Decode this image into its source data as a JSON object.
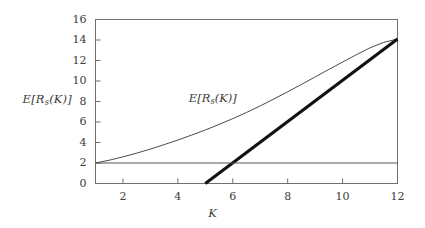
{
  "chart_data": {
    "type": "line",
    "title": "",
    "subtitle": "",
    "xlabel": "K",
    "ylabel": "E[R_s(K)]",
    "xlim": [
      1,
      12
    ],
    "ylim": [
      0,
      16
    ],
    "grid": false,
    "legend_position": "none",
    "xticks": [
      2,
      4,
      6,
      8,
      10,
      12
    ],
    "xtick_labels": [
      "2",
      "4",
      "6",
      "8",
      "10",
      "12"
    ],
    "yticks": [
      0,
      2,
      4,
      6,
      8,
      10,
      12,
      14,
      16
    ],
    "ytick_labels": [
      "0",
      "2",
      "4",
      "6",
      "8",
      "10",
      "12",
      "14",
      "16"
    ],
    "annotations": [
      {
        "text": "E[R_s(K)]",
        "x": 4.4,
        "y": 8.2
      }
    ],
    "series": [
      {
        "name": "E[R_s(K)]",
        "style": "thin-curve",
        "x": [
          1,
          1.5,
          2,
          2.5,
          3,
          3.5,
          4,
          4.5,
          5,
          5.5,
          6,
          6.5,
          7,
          7.5,
          8,
          8.5,
          9,
          9.5,
          10,
          10.5,
          11,
          11.5,
          12
        ],
        "values": [
          2.0,
          2.27,
          2.6,
          2.96,
          3.36,
          3.79,
          4.24,
          4.72,
          5.22,
          5.76,
          6.33,
          6.93,
          7.57,
          8.25,
          8.95,
          9.66,
          10.4,
          11.13,
          11.85,
          12.56,
          13.24,
          13.77,
          14.1
        ]
      },
      {
        "name": "asymptote-line",
        "style": "thick-line",
        "x": [
          5,
          12
        ],
        "values": [
          0,
          14.1
        ]
      },
      {
        "name": "baseline-level",
        "style": "thin-horizontal",
        "x": [
          1,
          12
        ],
        "values": [
          2,
          2
        ]
      }
    ]
  },
  "axes": {
    "ylabel_main": "E[R",
    "ylabel_sub": "s",
    "ylabel_tail": "(K)]",
    "xlabel": "K"
  },
  "annotation": {
    "main": "E[R",
    "sub": "s",
    "tail": "(K)]"
  },
  "colors": {
    "frame": "#6f6f6f",
    "thin_curve": "#4a4a4a",
    "thick_line": "#111111",
    "baseline": "#555555",
    "text": "#3b3b3b",
    "background": "#ffffff"
  }
}
